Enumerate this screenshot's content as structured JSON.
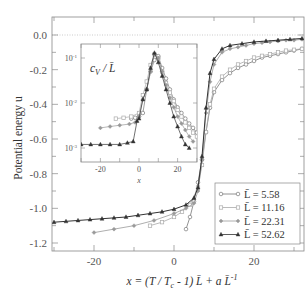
{
  "chart_data": [
    {
      "id": "main",
      "type": "line",
      "title": "",
      "xlabel": "x = (T / T_c - 1) L̄ + a L̄^-1",
      "ylabel": "Potential energy u",
      "xlim": [
        -30,
        32
      ],
      "ylim": [
        -1.25,
        0.1
      ],
      "xticks": [
        -20,
        0,
        20
      ],
      "xtick_labels": [
        "-20",
        "0",
        "20"
      ],
      "yticks": [
        0.0,
        -0.2,
        -0.4,
        -0.6,
        -0.8,
        -1.0,
        -1.2
      ],
      "ytick_labels": [
        "0.0",
        "-0.2",
        "-0.4",
        "-0.6",
        "-0.8",
        "-1.0",
        "-1.2"
      ],
      "reference_line": {
        "y": 0.0,
        "style": "dotted"
      },
      "grid": false,
      "legend_position": "lower right",
      "series": [
        {
          "name": "L̄ = 5.58",
          "marker": "circle-open",
          "color": "#888888",
          "x": [
            3,
            4,
            5,
            6,
            7,
            8,
            9,
            10,
            12,
            14,
            16,
            18,
            20,
            22,
            24,
            26,
            28,
            30,
            32
          ],
          "y": [
            -1.12,
            -1.05,
            -0.96,
            -0.85,
            -0.72,
            -0.56,
            -0.42,
            -0.33,
            -0.26,
            -0.22,
            -0.19,
            -0.17,
            -0.15,
            -0.13,
            -0.12,
            -0.11,
            -0.1,
            -0.09,
            -0.08
          ]
        },
        {
          "name": "L̄ = 11.16",
          "marker": "square-open",
          "color": "#aaaaaa",
          "x": [
            -6,
            -3,
            0,
            2,
            4,
            6,
            7,
            8,
            9,
            10,
            12,
            14,
            16,
            18,
            20,
            22,
            24,
            26,
            28,
            30,
            32
          ],
          "y": [
            -1.1,
            -1.08,
            -1.05,
            -1.02,
            -0.98,
            -0.88,
            -0.75,
            -0.56,
            -0.4,
            -0.31,
            -0.24,
            -0.2,
            -0.17,
            -0.15,
            -0.13,
            -0.12,
            -0.11,
            -0.1,
            -0.09,
            -0.085,
            -0.08
          ]
        },
        {
          "name": "L̄ = 22.31",
          "marker": "diamond",
          "color": "#999999",
          "x": [
            -20,
            -15,
            -10,
            -5,
            0,
            3,
            5,
            6,
            7,
            8,
            9,
            10,
            12,
            14,
            16,
            18,
            20,
            22,
            24,
            26,
            28,
            30,
            32
          ],
          "y": [
            -1.14,
            -1.12,
            -1.1,
            -1.07,
            -1.03,
            -1.0,
            -0.97,
            -0.9,
            -0.72,
            -0.45,
            -0.27,
            -0.17,
            -0.1,
            -0.08,
            -0.07,
            -0.06,
            -0.05,
            -0.045,
            -0.04,
            -0.035,
            -0.03,
            -0.03,
            -0.025
          ]
        },
        {
          "name": "L̄ = 52.62",
          "marker": "triangle",
          "color": "#333333",
          "x": [
            -30,
            -27,
            -24,
            -21,
            -18,
            -15,
            -12,
            -9,
            -6,
            -3,
            0,
            3,
            5,
            6,
            7,
            8,
            9,
            10,
            12,
            14,
            17,
            20,
            23,
            26,
            29,
            32
          ],
          "y": [
            -1.08,
            -1.075,
            -1.07,
            -1.065,
            -1.06,
            -1.055,
            -1.05,
            -1.04,
            -1.03,
            -1.02,
            -1.005,
            -0.98,
            -0.94,
            -0.88,
            -0.7,
            -0.42,
            -0.22,
            -0.14,
            -0.08,
            -0.06,
            -0.05,
            -0.04,
            -0.035,
            -0.03,
            -0.025,
            -0.02
          ]
        }
      ]
    },
    {
      "id": "inset",
      "type": "line",
      "title": "c_V / L̄",
      "xlabel": "x",
      "ylabel": "",
      "yscale": "log",
      "xlim": [
        -30,
        30
      ],
      "ylim": [
        0.0006,
        0.15
      ],
      "xticks": [
        -20,
        0,
        20
      ],
      "xtick_labels": [
        "-20",
        "0",
        "20"
      ],
      "yticks": [
        0.1,
        0.01,
        0.001
      ],
      "ytick_labels": [
        "10^-1",
        "10^-2",
        "10^-3"
      ],
      "grid": false,
      "series": [
        {
          "name": "L̄ = 5.58",
          "marker": "circle-open",
          "x": [
            -4,
            -2,
            0,
            2,
            4,
            6,
            8,
            10,
            12,
            14,
            16,
            18,
            20,
            22,
            24,
            26,
            28,
            30
          ],
          "y": [
            0.0045,
            0.0047,
            0.005,
            0.006,
            0.02,
            0.05,
            0.09,
            0.11,
            0.06,
            0.035,
            0.02,
            0.012,
            0.008,
            0.006,
            0.0045,
            0.0035,
            0.0028,
            0.0022
          ]
        },
        {
          "name": "L̄ = 11.16",
          "marker": "square-open",
          "x": [
            -12,
            -8,
            -4,
            0,
            2,
            4,
            6,
            8,
            10,
            12,
            14,
            16,
            18,
            20,
            22,
            24,
            26,
            28,
            30
          ],
          "y": [
            0.0045,
            0.0047,
            0.005,
            0.006,
            0.015,
            0.03,
            0.07,
            0.12,
            0.1,
            0.05,
            0.028,
            0.017,
            0.011,
            0.007,
            0.005,
            0.0037,
            0.0028,
            0.0022,
            0.0018
          ]
        },
        {
          "name": "L̄ = 22.31",
          "marker": "diamond",
          "x": [
            -20,
            -15,
            -10,
            -5,
            -2,
            0,
            2,
            4,
            6,
            8,
            10,
            12,
            14,
            16,
            18,
            20,
            22,
            24,
            26,
            28
          ],
          "y": [
            0.0028,
            0.003,
            0.0032,
            0.0034,
            0.0037,
            0.005,
            0.012,
            0.02,
            0.05,
            0.12,
            0.1,
            0.05,
            0.025,
            0.013,
            0.008,
            0.005,
            0.0035,
            0.0025,
            0.0018,
            0.0014
          ]
        },
        {
          "name": "L̄ = 52.62",
          "marker": "triangle",
          "x": [
            -30,
            -25,
            -20,
            -15,
            -10,
            -6,
            -3,
            -1,
            0,
            2,
            4,
            6,
            8,
            10,
            12,
            14,
            16,
            18,
            20,
            22,
            24,
            26
          ],
          "y": [
            0.0012,
            0.0012,
            0.0012,
            0.0012,
            0.0012,
            0.0013,
            0.0014,
            0.004,
            0.0045,
            0.012,
            0.02,
            0.06,
            0.13,
            0.08,
            0.04,
            0.02,
            0.01,
            0.005,
            0.003,
            0.0018,
            0.0012,
            0.001
          ]
        }
      ]
    }
  ],
  "labels": {
    "ylabel_main": "Potential energy u",
    "xlabel_main": "x = (T / T",
    "xlabel_sub_c": "c",
    "xlabel_rest": " - 1) L̄ + a L̄",
    "xlabel_sup": "-1",
    "inset_title": "c",
    "inset_title_sub": "V",
    "inset_title_rest": " / L̄",
    "inset_xlabel": "x"
  },
  "legend": [
    {
      "label": "L̄ = 5.58",
      "marker": "circle-open"
    },
    {
      "label": "L̄ = 11.16",
      "marker": "square-open"
    },
    {
      "label": "L̄ = 22.31",
      "marker": "diamond"
    },
    {
      "label": "L̄ = 52.62",
      "marker": "triangle"
    }
  ]
}
